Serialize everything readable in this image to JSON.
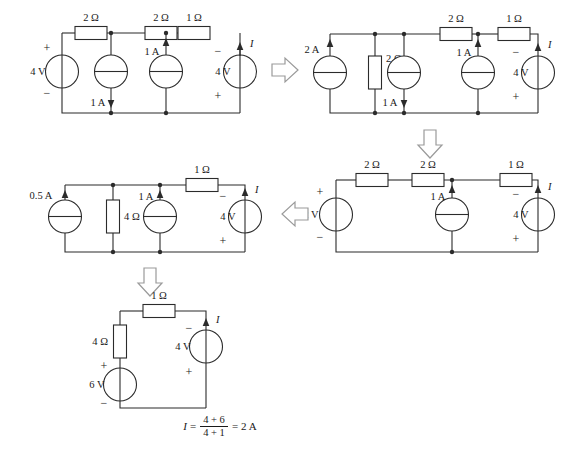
{
  "figure": {
    "background": "#ffffff",
    "ink": "#2b2b2b"
  },
  "circuits": [
    {
      "id": "circuit-1",
      "position": "top-left",
      "labels": {
        "r_top_left": "2 Ω",
        "r_top_mid": "2 Ω",
        "r_top_right": "1 Ω",
        "v_left": "4 V",
        "v_left_plus": "+",
        "v_left_minus": "−",
        "i_mid_left": "1 A",
        "i_mid_right": "1 A",
        "v_right": "4 V",
        "v_right_minus": "−",
        "v_right_plus": "+",
        "current_I": "I"
      }
    },
    {
      "id": "circuit-2",
      "position": "top-right",
      "labels": {
        "i_left": "2 A",
        "r_shunt": "2 Ω",
        "r_top_mid": "2 Ω",
        "r_top_right": "1 Ω",
        "i_mid_left": "1 A",
        "i_mid_right": "1 A",
        "v_right": "4 V",
        "v_right_minus": "−",
        "v_right_plus": "+",
        "current_I": "I"
      }
    },
    {
      "id": "circuit-3",
      "position": "middle-right",
      "labels": {
        "v_left": "2 V",
        "v_left_plus": "+",
        "v_left_minus": "−",
        "r_top_left": "2 Ω",
        "r_top_mid": "2 Ω",
        "r_top_right": "1 Ω",
        "i_mid": "1 A",
        "v_right": "4 V",
        "v_right_minus": "−",
        "v_right_plus": "+",
        "current_I": "I"
      }
    },
    {
      "id": "circuit-4",
      "position": "middle-left",
      "labels": {
        "i_left": "0.5 A",
        "r_shunt": "4 Ω",
        "i_mid": "1 A",
        "r_top_right": "1 Ω",
        "v_right": "4 V",
        "v_right_minus": "−",
        "v_right_plus": "+",
        "current_I": "I"
      }
    },
    {
      "id": "circuit-5",
      "position": "bottom",
      "labels": {
        "r_top": "1 Ω",
        "r_left": "4 Ω",
        "v_left": "6 V",
        "v_left_plus": "+",
        "v_left_minus": "−",
        "v_right": "4 V",
        "v_right_minus": "−",
        "v_right_plus": "+",
        "current_I": "I"
      }
    }
  ],
  "flow_arrows": [
    {
      "name": "arrow-1-to-2",
      "direction": "right"
    },
    {
      "name": "arrow-2-to-3",
      "direction": "down"
    },
    {
      "name": "arrow-3-to-4",
      "direction": "left"
    },
    {
      "name": "arrow-4-to-5",
      "direction": "down"
    }
  ],
  "equation": {
    "lhs": "I",
    "equals": "=",
    "numerator": "4 + 6",
    "denominator": "4 + 1",
    "equals2": "=",
    "result": "2 A"
  }
}
